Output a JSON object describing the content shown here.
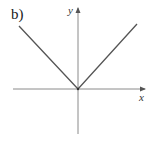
{
  "figure": {
    "panel_label": "b)",
    "x_axis_label": "x",
    "y_axis_label": "y"
  },
  "colors": {
    "axis": "#8a8a8a",
    "curve": "#555555",
    "text": "#1a1a1a"
  }
}
